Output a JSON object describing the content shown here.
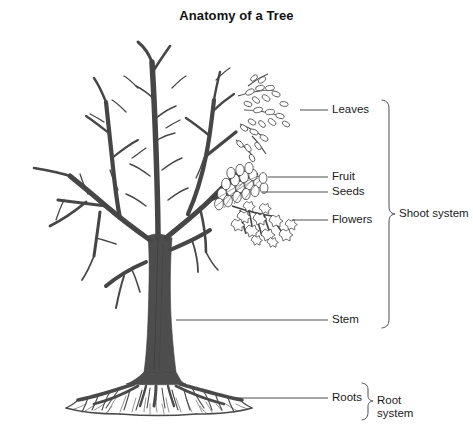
{
  "title": "Anatomy of a Tree",
  "colors": {
    "background": "#ffffff",
    "trunk": "#4a4a4a",
    "branch": "#434343",
    "outline": "#3a3a3a",
    "leader_line": "#4d4d4d",
    "text": "#1b1b1b"
  },
  "labels": {
    "leaves": "Leaves",
    "fruit": "Fruit",
    "seeds": "Seeds",
    "flowers": "Flowers",
    "stem": "Stem",
    "roots": "Roots"
  },
  "systems": {
    "shoot": "Shoot system",
    "root": "Root\nsystem"
  },
  "parts": [
    {
      "name": "leaves",
      "label": "Leaves",
      "leader_y": 110,
      "leader_x1": 300,
      "leader_x2": 328
    },
    {
      "name": "fruit",
      "label": "Fruit",
      "leader_y": 177,
      "leader_x1": 268,
      "leader_x2": 328
    },
    {
      "name": "seeds",
      "label": "Seeds",
      "leader_y": 192,
      "leader_x1": 262,
      "leader_x2": 328
    },
    {
      "name": "flowers",
      "label": "Flowers",
      "leader_y": 220,
      "leader_x1": 292,
      "leader_x2": 328
    },
    {
      "name": "stem",
      "label": "Stem",
      "leader_y": 320,
      "leader_x1": 176,
      "leader_x2": 328
    },
    {
      "name": "roots",
      "label": "Roots",
      "leader_y": 398,
      "leader_x1": 232,
      "leader_x2": 328
    }
  ],
  "brackets": [
    {
      "name": "shoot-system",
      "top": 100,
      "bottom": 328,
      "label": "Shoot system"
    },
    {
      "name": "root-system",
      "top": 383,
      "bottom": 420,
      "label": "Root system"
    }
  ]
}
